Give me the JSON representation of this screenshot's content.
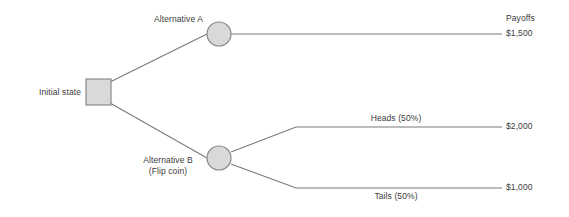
{
  "diagram": {
    "type": "decision-tree",
    "title": "",
    "colors": {
      "background": "#ffffff",
      "line": "#7a7a7a",
      "node_fill": "#d9d9d9",
      "node_stroke": "#8a8a8a",
      "text": "#3b3b3b"
    },
    "nodes": {
      "initial_state": {
        "label": "Initial state",
        "shape": "square"
      },
      "alternative_a": {
        "label": "Alternative A",
        "shape": "circle"
      },
      "alternative_b": {
        "label_line1": "Alternative B",
        "label_line2": "(Flip coin)",
        "shape": "circle"
      }
    },
    "branches": {
      "heads": "Heads (50%)",
      "tails": "Tails (50%)"
    },
    "payoffs": {
      "header": "Payoffs",
      "alternative_a": "$1,500",
      "heads": "$2,000",
      "tails": "$1,000"
    }
  }
}
